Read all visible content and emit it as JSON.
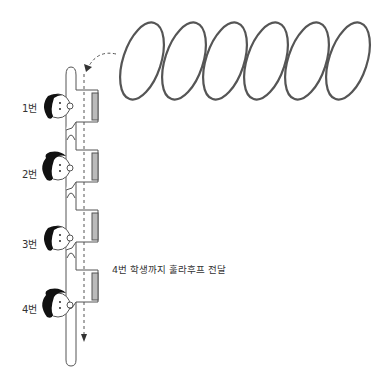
{
  "diagram": {
    "hoop_count": 6,
    "colors": {
      "line": "#555555",
      "hair": "#111111",
      "cuff": "#bbbbbb",
      "text": "#333333"
    },
    "students": [
      {
        "label": "1번",
        "hair": "short"
      },
      {
        "label": "2번",
        "hair": "ponytail"
      },
      {
        "label": "3번",
        "hair": "short"
      },
      {
        "label": "4번",
        "hair": "ponytail"
      }
    ],
    "caption": "4번 학생까지 훌라후프 전달"
  }
}
